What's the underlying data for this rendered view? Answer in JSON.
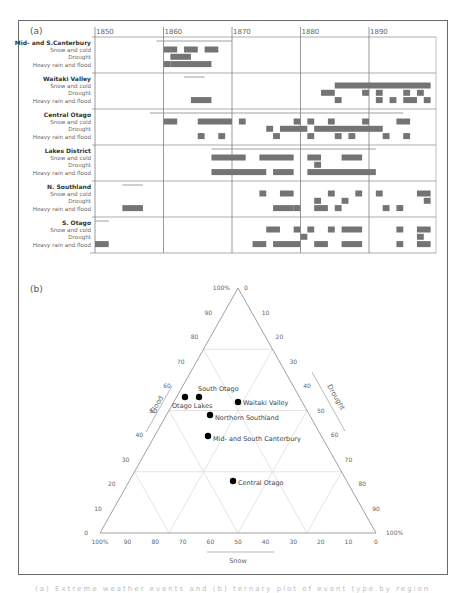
{
  "panel_a": {
    "label": "(a)",
    "years": [
      1850,
      1860,
      1870,
      1880,
      1890
    ],
    "sections": [
      {
        "name": "Mid- and S.Canterbury",
        "rows": [
          "Snow and cold",
          "Drought",
          "Heavy rain and flood"
        ]
      },
      {
        "name": "Waitaki Valley",
        "rows": [
          "Snow and cold",
          "Drought",
          "Heavy rain and flood"
        ]
      },
      {
        "name": "Central Otago",
        "rows": [
          "Snow and cold",
          "Drought",
          "Heavy rain and flood"
        ]
      },
      {
        "name": "Lakes District",
        "rows": [
          "Snow and cold",
          "Drought",
          "Heavy rain and flood"
        ]
      },
      {
        "name": "N. Southland",
        "rows": [
          "Snow and cold",
          "Drought",
          "Heavy rain and flood"
        ]
      },
      {
        "name": "S. Otago",
        "rows": [
          "Snow and cold",
          "Drought",
          "Heavy rain and flood"
        ]
      }
    ]
  },
  "panel_b": {
    "label": "(b)",
    "axis_flood": "Flood",
    "axis_drought": "Drought",
    "axis_snow": "Snow",
    "left_ticks": [
      "0",
      "10",
      "20",
      "30",
      "40",
      "50",
      "60",
      "70",
      "80",
      "90",
      "100%"
    ],
    "right_ticks": [
      "0",
      "10",
      "20",
      "30",
      "40",
      "50",
      "60",
      "70",
      "80",
      "90",
      "100%"
    ],
    "bottom_ticks": [
      "100%",
      "90",
      "80",
      "70",
      "60",
      "50",
      "40",
      "30",
      "20",
      "10",
      "0"
    ]
  },
  "caption": "(a) Extreme weather events and (b) ternary plot of event type by region",
  "chart_data": [
    {
      "type": "timeline",
      "title": "(a)",
      "x_axis": {
        "ticks": [
          1850,
          1860,
          1870,
          1880,
          1890
        ],
        "range": [
          1850,
          1899
        ]
      },
      "series": [
        {
          "region": "Mid- and S.Canterbury",
          "record_span": [
            1859,
            1870
          ],
          "snow_and_cold": [
            [
              1860,
              1862
            ],
            [
              1863,
              1865
            ],
            [
              1866,
              1868
            ]
          ],
          "drought": [
            [
              1861,
              1864
            ]
          ],
          "heavy_rain_and_flood": [
            [
              1860,
              1861
            ],
            [
              1861,
              1867
            ]
          ]
        },
        {
          "region": "Waitaki Valley",
          "record_span": [
            1863,
            1866
          ],
          "snow_and_cold": [
            [
              1885,
              1899
            ]
          ],
          "drought": [
            [
              1883,
              1885
            ],
            [
              1889,
              1890
            ],
            [
              1891,
              1892
            ],
            [
              1895,
              1896
            ],
            [
              1897,
              1898
            ]
          ],
          "heavy_rain_and_flood": [
            [
              1864,
              1867
            ],
            [
              1885,
              1886
            ],
            [
              1891,
              1892
            ],
            [
              1893,
              1894
            ],
            [
              1895,
              1897
            ],
            [
              1898,
              1899
            ]
          ]
        },
        {
          "region": "Central Otago",
          "record_span": [
            1858,
            1895
          ],
          "snow_and_cold": [
            [
              1860,
              1862
            ],
            [
              1865,
              1870
            ],
            [
              1871,
              1872
            ],
            [
              1879,
              1880
            ],
            [
              1881,
              1882
            ],
            [
              1884,
              1885
            ],
            [
              1889,
              1890
            ],
            [
              1894,
              1896
            ]
          ],
          "drought": [
            [
              1875,
              1876
            ],
            [
              1877,
              1881
            ],
            [
              1882,
              1892
            ]
          ],
          "heavy_rain_and_flood": [
            [
              1865,
              1866
            ],
            [
              1868,
              1869
            ],
            [
              1876,
              1877
            ],
            [
              1881,
              1882
            ],
            [
              1885,
              1886
            ],
            [
              1887,
              1888
            ],
            [
              1892,
              1893
            ],
            [
              1895,
              1896
            ]
          ]
        },
        {
          "region": "Lakes District",
          "record_span": [
            1867,
            1891
          ],
          "snow_and_cold": [
            [
              1867,
              1872
            ],
            [
              1874,
              1879
            ],
            [
              1881,
              1883
            ],
            [
              1886,
              1889
            ]
          ],
          "drought": [
            [
              1882,
              1883
            ]
          ],
          "heavy_rain_and_flood": [
            [
              1867,
              1875
            ],
            [
              1876,
              1879
            ],
            [
              1881,
              1891
            ]
          ]
        },
        {
          "region": "N. Southland",
          "record_span": [
            1854,
            1857
          ],
          "snow_and_cold": [
            [
              1874,
              1875
            ],
            [
              1877,
              1879
            ],
            [
              1884,
              1885
            ],
            [
              1888,
              1889
            ],
            [
              1891,
              1892
            ],
            [
              1897,
              1899
            ]
          ],
          "drought": [
            [
              1882,
              1883
            ],
            [
              1886,
              1887
            ],
            [
              1898,
              1899
            ]
          ],
          "heavy_rain_and_flood": [
            [
              1854,
              1857
            ],
            [
              1876,
              1879
            ],
            [
              1879,
              1880
            ],
            [
              1882,
              1884
            ],
            [
              1885,
              1886
            ],
            [
              1892,
              1893
            ],
            [
              1894,
              1895
            ]
          ]
        },
        {
          "region": "S. Otago",
          "record_span": [
            1850,
            1852
          ],
          "snow_and_cold": [
            [
              1875,
              1877
            ],
            [
              1879,
              1880
            ],
            [
              1881,
              1882
            ],
            [
              1884,
              1885
            ],
            [
              1886,
              1889
            ],
            [
              1894,
              1895
            ],
            [
              1897,
              1899
            ]
          ],
          "drought": [
            [
              1880,
              1881
            ],
            [
              1897,
              1898
            ]
          ],
          "heavy_rain_and_flood": [
            [
              1850,
              1852
            ],
            [
              1873,
              1875
            ],
            [
              1876,
              1880
            ],
            [
              1882,
              1884
            ],
            [
              1886,
              1889
            ],
            [
              1894,
              1895
            ],
            [
              1897,
              1899
            ]
          ]
        }
      ]
    },
    {
      "type": "scatter",
      "subtype": "ternary",
      "title": "(b)",
      "axes": [
        "Flood",
        "Drought",
        "Snow"
      ],
      "points": [
        {
          "label": "Otago Lakes",
          "flood": 54,
          "drought": 29,
          "snow": 17
        },
        {
          "label": "South Otago",
          "flood": 54,
          "drought": 32,
          "snow": 14
        },
        {
          "label": "Waitaki Valley",
          "flood": 51,
          "drought": 40,
          "snow": 9
        },
        {
          "label": "Northern Southland",
          "flood": 46,
          "drought": 38,
          "snow": 16
        },
        {
          "label": "Mid- and South Canterbury",
          "flood": 38,
          "drought": 43,
          "snow": 19
        },
        {
          "label": "Central Otago",
          "flood": 22,
          "drought": 58,
          "snow": 20
        }
      ],
      "grid": true
    }
  ]
}
